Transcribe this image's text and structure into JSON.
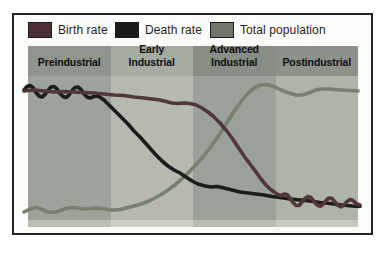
{
  "palette": {
    "frame_border": "#242424",
    "figure_background": "#fcfcfa"
  },
  "legend": {
    "items": [
      {
        "label": "Birth rate",
        "color": "#4d3136"
      },
      {
        "label": "Death rate",
        "color": "#1b1b1b"
      },
      {
        "label": "Total population",
        "color": "#6f766a"
      }
    ]
  },
  "stages": [
    {
      "label": "Preindustrial",
      "top_line": "",
      "bottom_line": "Preindustrial",
      "header_color": "#8f958c",
      "body_color": "#9da39b",
      "strip_color": "#bbc0b4"
    },
    {
      "label": "Early Industrial",
      "top_line": "Early",
      "bottom_line": "Industrial",
      "header_color": "#a6aca1",
      "body_color": "#b5b9ae",
      "strip_color": "#cdd0c4"
    },
    {
      "label": "Advanced Industrial",
      "top_line": "Advanced",
      "bottom_line": "Industrial",
      "header_color": "#878e84",
      "body_color": "#9aa198",
      "strip_color": "#b8bdb1"
    },
    {
      "label": "Postindustrial",
      "top_line": "",
      "bottom_line": "Postindustrial",
      "header_color": "#8c9289",
      "body_color": "#afb4a9",
      "strip_color": "#c7cbbf"
    }
  ],
  "chart_data": {
    "type": "line",
    "title": "",
    "categories": [
      "Preindustrial",
      "Early Industrial",
      "Advanced Industrial",
      "Postindustrial"
    ],
    "legend_position": "top",
    "axes_visible": false,
    "note": "Demographic transition diagram; series points are in screenshot pixel coordinates (y increases downward). Drawn bottom-to-top in array order.",
    "series": [
      {
        "id": "total-population-line",
        "name": "Total population",
        "color": "#78806f",
        "trend": "low with small fluctuations in Preindustrial, S-curve rise through Early and Advanced Industrial, high plateau in Postindustrial",
        "points": [
          [
            24,
            212
          ],
          [
            30,
            209
          ],
          [
            36,
            207.5
          ],
          [
            42,
            209.5
          ],
          [
            48,
            212
          ],
          [
            54,
            212.5
          ],
          [
            60,
            210.5
          ],
          [
            66,
            208.5
          ],
          [
            72,
            207.5
          ],
          [
            78,
            208
          ],
          [
            84,
            209
          ],
          [
            90,
            208.5
          ],
          [
            96,
            208
          ],
          [
            102,
            208.5
          ],
          [
            108,
            209.5
          ],
          [
            114,
            210
          ],
          [
            120,
            209.5
          ],
          [
            126,
            208
          ],
          [
            132,
            206.5
          ],
          [
            138,
            205
          ],
          [
            144,
            203
          ],
          [
            150,
            200.5
          ],
          [
            156,
            197.5
          ],
          [
            162,
            194
          ],
          [
            168,
            190
          ],
          [
            174,
            185.5
          ],
          [
            180,
            180.5
          ],
          [
            186,
            175
          ],
          [
            192,
            169
          ],
          [
            198,
            162.5
          ],
          [
            204,
            155.5
          ],
          [
            210,
            148
          ],
          [
            216,
            139.5
          ],
          [
            222,
            130.5
          ],
          [
            228,
            121
          ],
          [
            234,
            111.5
          ],
          [
            240,
            103
          ],
          [
            246,
            95.5
          ],
          [
            251,
            90.5
          ],
          [
            256,
            87
          ],
          [
            261,
            85
          ],
          [
            266,
            84.5
          ],
          [
            271,
            85.5
          ],
          [
            276,
            87.5
          ],
          [
            281,
            90
          ],
          [
            286,
            92
          ],
          [
            291,
            93.5
          ],
          [
            296,
            95
          ],
          [
            301,
            95
          ],
          [
            306,
            94
          ],
          [
            311,
            92
          ],
          [
            316,
            90
          ],
          [
            321,
            89
          ],
          [
            328,
            89
          ],
          [
            335,
            89.5
          ],
          [
            342,
            90
          ],
          [
            350,
            90.5
          ],
          [
            358,
            91
          ]
        ]
      },
      {
        "id": "death-rate-line",
        "name": "Death rate",
        "color": "#1d1c1c",
        "trend": "high and fluctuating in Preindustrial, steep fall through Early Industrial, low and slowly declining afterwards",
        "points": [
          [
            24,
            90
          ],
          [
            27,
            86.5
          ],
          [
            30,
            85.5
          ],
          [
            33,
            87.5
          ],
          [
            36,
            92.5
          ],
          [
            39,
            96
          ],
          [
            42,
            97
          ],
          [
            45,
            94.5
          ],
          [
            48,
            90.5
          ],
          [
            51,
            87
          ],
          [
            54,
            86.5
          ],
          [
            57,
            89
          ],
          [
            60,
            93.5
          ],
          [
            63,
            96.5
          ],
          [
            66,
            97.5
          ],
          [
            69,
            95
          ],
          [
            72,
            90.5
          ],
          [
            75,
            87.5
          ],
          [
            78,
            87
          ],
          [
            81,
            89.5
          ],
          [
            84,
            94
          ],
          [
            87,
            97
          ],
          [
            90,
            98
          ],
          [
            94,
            96.5
          ],
          [
            98,
            96
          ],
          [
            104,
            100
          ],
          [
            112,
            108
          ],
          [
            120,
            116
          ],
          [
            128,
            124
          ],
          [
            134,
            131
          ],
          [
            140,
            137
          ],
          [
            148,
            146
          ],
          [
            156,
            155
          ],
          [
            162,
            161
          ],
          [
            168,
            166
          ],
          [
            174,
            170
          ],
          [
            180,
            173
          ],
          [
            186,
            177
          ],
          [
            192,
            181
          ],
          [
            198,
            184
          ],
          [
            205,
            186
          ],
          [
            211,
            187
          ],
          [
            217,
            186.5
          ],
          [
            224,
            188
          ],
          [
            232,
            190
          ],
          [
            240,
            192
          ],
          [
            248,
            193
          ],
          [
            256,
            194
          ],
          [
            264,
            195
          ],
          [
            272,
            196.5
          ],
          [
            280,
            197.5
          ],
          [
            290,
            199
          ],
          [
            300,
            200
          ],
          [
            310,
            201
          ],
          [
            320,
            202.5
          ],
          [
            330,
            203.5
          ],
          [
            342,
            205
          ],
          [
            352,
            206
          ],
          [
            360,
            206.5
          ]
        ]
      },
      {
        "id": "birth-rate-line",
        "name": "Birth rate",
        "color": "#523639",
        "trend": "high through Preindustrial and Early Industrial, steep fall through Advanced Industrial, low and oscillating in Postindustrial",
        "points": [
          [
            24,
            91
          ],
          [
            34,
            90
          ],
          [
            44,
            91
          ],
          [
            54,
            92
          ],
          [
            64,
            91.5
          ],
          [
            74,
            92
          ],
          [
            84,
            92.5
          ],
          [
            94,
            93
          ],
          [
            104,
            94
          ],
          [
            114,
            95
          ],
          [
            124,
            95.5
          ],
          [
            134,
            97
          ],
          [
            144,
            98
          ],
          [
            152,
            99
          ],
          [
            160,
            100
          ],
          [
            166,
            101.5
          ],
          [
            172,
            103
          ],
          [
            178,
            103.5
          ],
          [
            184,
            103
          ],
          [
            190,
            103.5
          ],
          [
            196,
            105
          ],
          [
            202,
            108
          ],
          [
            208,
            112
          ],
          [
            214,
            117
          ],
          [
            220,
            123
          ],
          [
            226,
            130
          ],
          [
            232,
            138
          ],
          [
            238,
            147
          ],
          [
            244,
            156
          ],
          [
            250,
            164
          ],
          [
            256,
            172
          ],
          [
            261,
            179
          ],
          [
            266,
            185
          ],
          [
            270,
            189
          ],
          [
            274,
            192
          ],
          [
            278,
            194.5
          ],
          [
            281,
            195.5
          ],
          [
            284,
            194
          ],
          [
            287,
            194.5
          ],
          [
            290,
            198
          ],
          [
            293,
            202.5
          ],
          [
            296,
            205.5
          ],
          [
            299,
            205.5
          ],
          [
            302,
            202
          ],
          [
            305,
            198.5
          ],
          [
            308,
            196.5
          ],
          [
            311,
            197.5
          ],
          [
            314,
            201.5
          ],
          [
            317,
            205
          ],
          [
            320,
            206.5
          ],
          [
            323,
            204.5
          ],
          [
            326,
            200.5
          ],
          [
            329,
            198
          ],
          [
            332,
            198.5
          ],
          [
            335,
            202
          ],
          [
            338,
            205.5
          ],
          [
            341,
            207
          ],
          [
            344,
            205
          ],
          [
            347,
            201.5
          ],
          [
            350,
            199.5
          ],
          [
            353,
            200.5
          ],
          [
            356,
            203.5
          ],
          [
            360,
            205
          ]
        ]
      }
    ],
    "line_width": 3.6
  }
}
